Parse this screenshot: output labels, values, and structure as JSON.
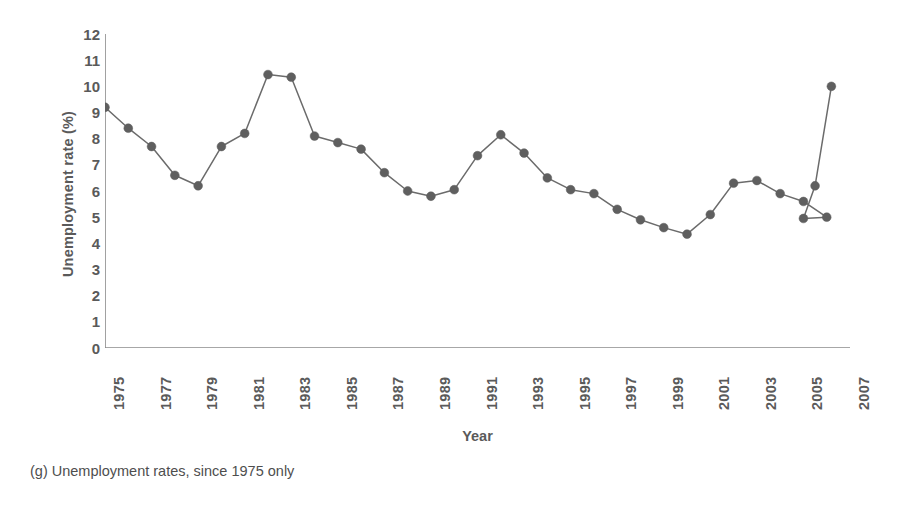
{
  "figure": {
    "caption": "(g) Unemployment rates, since 1975 only",
    "xlabel": "Year",
    "ylabel": "Unemployment rate (%)"
  },
  "style": {
    "line_color": "#6b6b6b",
    "marker_color": "#5f5f5f",
    "axis_color": "#8a8a8a",
    "text_color": "#5a5a5a"
  },
  "chart_data": {
    "type": "line",
    "title": "",
    "subtitle": "",
    "xlabel": "Year",
    "ylabel": "Unemployment rate (%)",
    "xlim": [
      1975,
      2007
    ],
    "ylim": [
      0,
      12
    ],
    "ytick_labels": [
      "12",
      "11",
      "10",
      "9",
      "8",
      "7",
      "6",
      "5",
      "4",
      "3",
      "2",
      "1",
      "0"
    ],
    "ytick_values": [
      12,
      11,
      10,
      9,
      8,
      7,
      6,
      5,
      4,
      3,
      2,
      1,
      0
    ],
    "xtick_labels": [
      "1975",
      "1977",
      "1979",
      "1981",
      "1983",
      "1985",
      "1987",
      "1989",
      "1991",
      "1993",
      "1995",
      "1997",
      "1999",
      "2001",
      "2003",
      "2005",
      "2007"
    ],
    "xtick_values": [
      1975,
      1977,
      1979,
      1981,
      1983,
      1985,
      1987,
      1989,
      1991,
      1993,
      1995,
      1997,
      1999,
      2001,
      2003,
      2005,
      2007
    ],
    "grid": false,
    "legend": null,
    "markers": true,
    "x": [
      1975,
      1976,
      1977,
      1978,
      1979,
      1980,
      1981,
      1982,
      1983,
      1984,
      1985,
      1986,
      1987,
      1988,
      1989,
      1990,
      1991,
      1992,
      1993,
      1994,
      1995,
      1996,
      1997,
      1998,
      1999,
      2000,
      2001,
      2002,
      2003,
      2004,
      2005,
      2006
    ],
    "values": [
      9.2,
      8.4,
      7.7,
      6.6,
      6.2,
      7.7,
      8.2,
      10.45,
      10.35,
      8.1,
      7.85,
      7.6,
      6.7,
      6.0,
      5.8,
      6.05,
      7.35,
      8.15,
      7.45,
      6.5,
      6.05,
      5.9,
      5.3,
      4.9,
      4.6,
      4.35,
      5.1,
      6.3,
      6.4,
      5.9,
      5.6,
      5.0
    ],
    "series": [
      {
        "name": "Unemployment rate (%)",
        "values": [
          9.2,
          8.4,
          7.7,
          6.6,
          6.2,
          7.7,
          8.2,
          10.45,
          10.35,
          8.1,
          7.85,
          7.6,
          6.7,
          6.0,
          5.8,
          6.05,
          7.35,
          8.15,
          7.45,
          6.5,
          6.05,
          5.9,
          5.3,
          4.9,
          4.6,
          4.35,
          5.1,
          6.3,
          6.4,
          5.9,
          5.6,
          5.0
        ]
      }
    ]
  },
  "chart_points_extra": {
    "note_points": [
      {
        "x": 2005,
        "y": 4.95
      },
      {
        "x": 2005.5,
        "y": 6.2
      },
      {
        "x": 2006.2,
        "y": 10.0
      }
    ]
  }
}
